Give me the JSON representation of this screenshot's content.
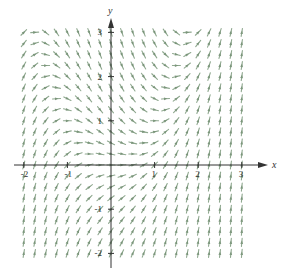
{
  "chart_data": {
    "type": "slope_field",
    "title": "",
    "equation": "dy/dx = x^2 - y",
    "xlabel": "x",
    "ylabel": "y",
    "xlim": [
      -2,
      3
    ],
    "ylim": [
      -2,
      3
    ],
    "x_ticks": [
      -2,
      -1,
      1,
      2,
      3
    ],
    "x_tick_labels": [
      "-2",
      "-1",
      "1",
      "2",
      "3"
    ],
    "y_ticks": [
      -2,
      -1,
      1,
      2,
      3
    ],
    "y_tick_labels": [
      "-2",
      "-1",
      "1",
      "2",
      "3"
    ],
    "grid": false,
    "field_grid": {
      "x_start": -2,
      "x_end": 3,
      "y_start": -2,
      "y_end": 3,
      "step": 0.25
    },
    "segment_length_px": 8,
    "segment_color": "#8fa88f",
    "axis_color": "#333333",
    "legend": []
  },
  "layout": {
    "origin_px": [
      111,
      165
    ],
    "px_per_unit_x": 43.6,
    "px_per_unit_y": 44.2
  }
}
